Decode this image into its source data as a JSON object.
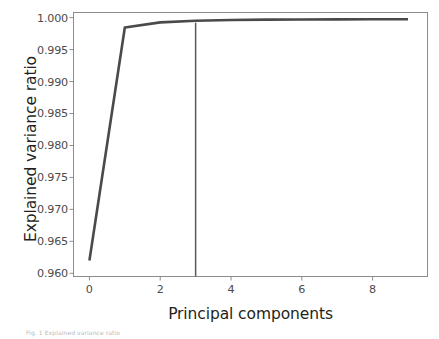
{
  "figure": {
    "background_color": "#ffffff",
    "frame_color": "#8c8c8c",
    "line_color": "#4a4a4a",
    "marker_line_color": "#5a5a5a",
    "tick_label_color": "#4c4c4c",
    "axis_label_color": "#231f20"
  },
  "caption": {
    "text": "Fig. 1  Explained variance ratio"
  },
  "chart_data": {
    "type": "line",
    "title": "",
    "xlabel": "Principal components",
    "ylabel": "Explained variance ratio",
    "xlim": [
      -0.45,
      9.55
    ],
    "ylim": [
      0.9595,
      1.0008
    ],
    "xticks": [
      0,
      2,
      4,
      6,
      8
    ],
    "xticklabels": [
      "0",
      "2",
      "4",
      "6",
      "8"
    ],
    "yticks": [
      0.96,
      0.965,
      0.97,
      0.975,
      0.98,
      0.985,
      0.99,
      0.995,
      1.0
    ],
    "yticklabels": [
      "0.960",
      "0.965",
      "0.970",
      "0.975",
      "0.980",
      "0.985",
      "0.990",
      "0.995",
      "1.000"
    ],
    "grid": false,
    "legend": null,
    "series": [
      {
        "name": "Cumulative explained variance ratio",
        "x": [
          0,
          1,
          2,
          3,
          4,
          5,
          6,
          7,
          8,
          9
        ],
        "values": [
          0.962,
          0.99845,
          0.99925,
          0.99951,
          0.99962,
          0.99968,
          0.99971,
          0.99973,
          0.99974,
          0.99975
        ]
      }
    ],
    "annotations": [
      {
        "type": "vline",
        "name": "selected-components-marker",
        "x": 3,
        "label": ""
      }
    ]
  }
}
